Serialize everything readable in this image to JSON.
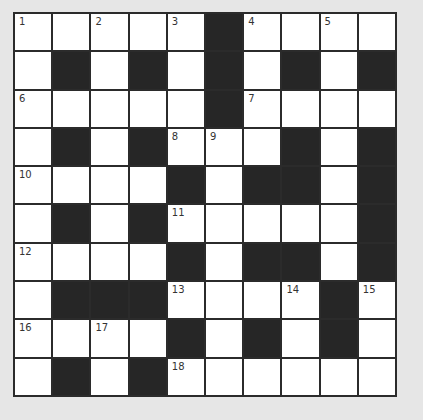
{
  "puzzle": {
    "rows": 10,
    "cols": 10,
    "colors": {
      "black": "#262626",
      "white": "#ffffff",
      "border": "#2b2b2b",
      "background": "#e6e6e6"
    },
    "grid": [
      [
        "1",
        "",
        "2",
        "",
        "3",
        "#",
        "4",
        "",
        "5",
        ""
      ],
      [
        "",
        "#",
        "",
        "#",
        "",
        "#",
        "",
        "#",
        "",
        "#"
      ],
      [
        "6",
        "",
        "",
        "",
        "",
        "#",
        "7",
        "",
        "",
        ""
      ],
      [
        "",
        "#",
        "",
        "#",
        "8",
        "9",
        "",
        "#",
        "",
        "#"
      ],
      [
        "10",
        "",
        "",
        "",
        "#",
        "",
        "#",
        "#",
        "",
        "#"
      ],
      [
        "",
        "#",
        "",
        "#",
        "11",
        "",
        "",
        "",
        "",
        "#"
      ],
      [
        "12",
        "",
        "",
        "",
        "#",
        "",
        "#",
        "#",
        "",
        "#"
      ],
      [
        "",
        "#",
        "#",
        "#",
        "13",
        "",
        "",
        "14",
        "#",
        "15"
      ],
      [
        "16",
        "",
        "17",
        "",
        "#",
        "",
        "#",
        "",
        "#",
        ""
      ],
      [
        "",
        "#",
        "",
        "#",
        "18",
        "",
        "",
        "",
        "",
        ""
      ]
    ]
  }
}
